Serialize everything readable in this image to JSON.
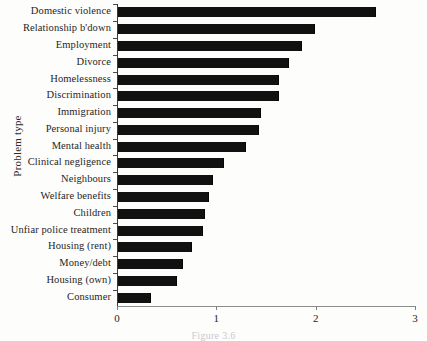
{
  "figure": {
    "caption": "Figure 3.6",
    "background_color": "#fdfdfb",
    "bar_color": "#111111",
    "axis_color": "#3a3a3a"
  },
  "chart_data": {
    "type": "bar",
    "orientation": "horizontal",
    "title": "",
    "xlabel": "",
    "ylabel": "Problem type",
    "xlim": [
      0,
      3
    ],
    "xticks": [
      0,
      1,
      2,
      3
    ],
    "xtick_labels": [
      "0",
      "1",
      "2",
      "3"
    ],
    "grid": false,
    "legend": null,
    "categories": [
      "Domestic violence",
      "Relationship b'down",
      "Employment",
      "Divorce",
      "Homelessness",
      "Discrimination",
      "Immigration",
      "Personal injury",
      "Mental health",
      "Clinical negligence",
      "Neighbours",
      "Welfare benefits",
      "Children",
      "Unfiar police treatment",
      "Housing (rent)",
      "Money/debt",
      "Housing (own)",
      "Consumer"
    ],
    "values": [
      2.6,
      1.98,
      1.85,
      1.72,
      1.62,
      1.62,
      1.44,
      1.42,
      1.29,
      1.07,
      0.96,
      0.92,
      0.88,
      0.86,
      0.74,
      0.65,
      0.59,
      0.33
    ]
  }
}
